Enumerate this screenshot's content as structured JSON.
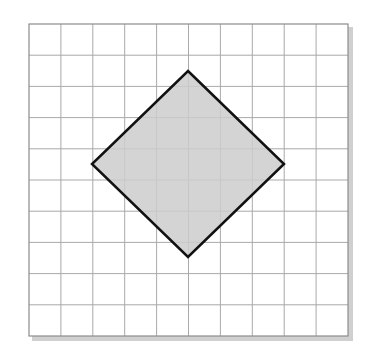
{
  "figure": {
    "grid": {
      "columns": 10,
      "rows": 10,
      "x0": 29,
      "y0": 24,
      "x1": 348,
      "y1": 336,
      "line_color": "#a9a9a9",
      "border_color": "#8c8c8c",
      "shadow_color": "#d0d0d0"
    },
    "shape": {
      "type": "polygon",
      "points": [
        [
          188,
          71
        ],
        [
          284,
          164
        ],
        [
          188,
          257
        ],
        [
          92,
          164
        ]
      ],
      "fill": "#cccccc",
      "stroke": "#111111",
      "stroke_width": 2.5
    }
  }
}
